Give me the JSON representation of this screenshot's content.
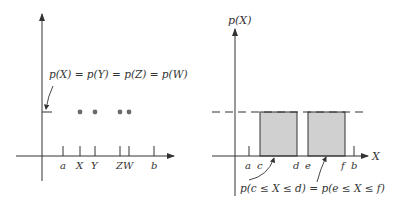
{
  "left_panel": {
    "title": "Discrete uniform",
    "annotation": "p(X) = p(Y) = p(Z) = p(W)",
    "tick_labels": [
      "a",
      "X",
      "Y",
      "ZW",
      "b"
    ],
    "points": [
      "X",
      "Y",
      "Z",
      "W"
    ]
  },
  "right_panel": {
    "y_axis_label": "p(X)",
    "x_axis_label": "X",
    "tick_labels": [
      "a",
      "c",
      "d",
      "e",
      "f",
      "b"
    ],
    "annotation": "p(c ≤ X ≤ d) = p(e ≤ X ≤ f)",
    "regions": [
      {
        "from": "c",
        "to": "d",
        "fill": "#d0d0d0"
      },
      {
        "from": "e",
        "to": "f",
        "fill": "#d0d0d0"
      }
    ]
  },
  "colors": {
    "ink": "#333333",
    "shade": "#d0d0d0",
    "dot": "#6a6a6a"
  }
}
